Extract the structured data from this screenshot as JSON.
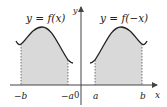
{
  "diagram": {
    "type": "function-reflection",
    "left_graph": {
      "label": "y = f(x)",
      "interval_start": "−b",
      "interval_end": "−a"
    },
    "right_graph": {
      "label": "y = f(−x)",
      "interval_start": "a",
      "interval_end": "b"
    },
    "axes": {
      "x_label": "x",
      "y_label": "y",
      "origin_label": "0"
    },
    "colors": {
      "curve": "#222222",
      "shade": "#d9d9d9",
      "axis": "#444444",
      "dash": "#555555"
    }
  }
}
